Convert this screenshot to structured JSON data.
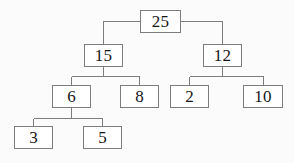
{
  "diagram": {
    "type": "binary-tree",
    "background_color": "#fbfbfb",
    "box_fill_color": "#ffffff",
    "box_border_color": "#7d7d7d",
    "edge_color": "#7d7d7d",
    "text_color": "#161616",
    "nodes": [
      {
        "id": "n25",
        "label": "25",
        "x": 140,
        "y": 10,
        "w": 41,
        "h": 23
      },
      {
        "id": "n15",
        "label": "15",
        "x": 84,
        "y": 44,
        "w": 39,
        "h": 23
      },
      {
        "id": "n12",
        "label": "12",
        "x": 203,
        "y": 44,
        "w": 39,
        "h": 23
      },
      {
        "id": "n6",
        "label": "6",
        "x": 52,
        "y": 85,
        "w": 39,
        "h": 23
      },
      {
        "id": "n8",
        "label": "8",
        "x": 120,
        "y": 85,
        "w": 39,
        "h": 23
      },
      {
        "id": "n2",
        "label": "2",
        "x": 170,
        "y": 85,
        "w": 39,
        "h": 23
      },
      {
        "id": "n10",
        "label": "10",
        "x": 243,
        "y": 85,
        "w": 40,
        "h": 23
      },
      {
        "id": "n3",
        "label": "3",
        "x": 14,
        "y": 126,
        "w": 39,
        "h": 23
      },
      {
        "id": "n5",
        "label": "5",
        "x": 83,
        "y": 126,
        "w": 39,
        "h": 23
      }
    ],
    "edges": [
      {
        "from": "n25",
        "to": "n15"
      },
      {
        "from": "n25",
        "to": "n12"
      },
      {
        "from": "n15",
        "to": "n6"
      },
      {
        "from": "n15",
        "to": "n8"
      },
      {
        "from": "n12",
        "to": "n2"
      },
      {
        "from": "n12",
        "to": "n10"
      },
      {
        "from": "n6",
        "to": "n3"
      },
      {
        "from": "n6",
        "to": "n5"
      }
    ]
  }
}
